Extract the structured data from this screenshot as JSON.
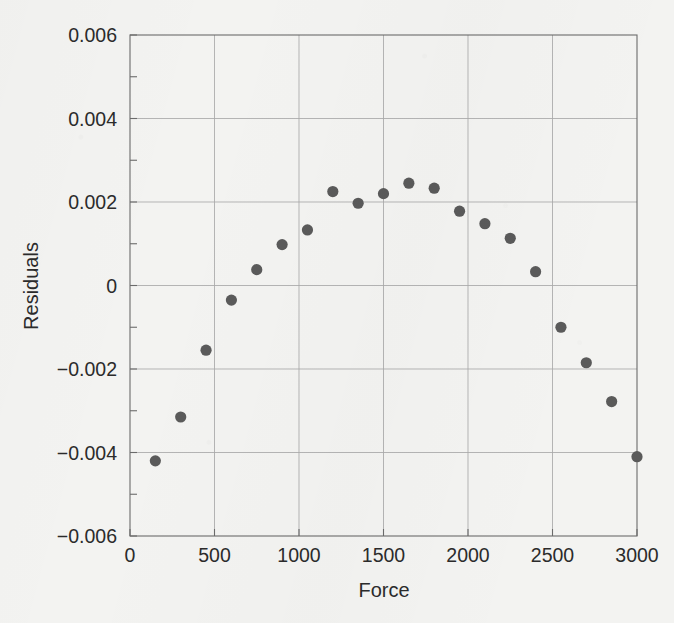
{
  "chart_data": {
    "type": "scatter",
    "title": "",
    "xlabel": "Force",
    "ylabel": "Residuals",
    "xlim": [
      0,
      3000
    ],
    "ylim": [
      -0.006,
      0.006
    ],
    "grid": true,
    "legend": null,
    "x_ticks": [
      0,
      500,
      1000,
      1500,
      2000,
      2500,
      3000
    ],
    "x_tick_labels": [
      "0",
      "500",
      "1000",
      "1500",
      "2000",
      "2500",
      "3000"
    ],
    "y_ticks": [
      -0.006,
      -0.004,
      -0.002,
      0,
      0.002,
      0.004,
      0.006
    ],
    "y_tick_labels": [
      "−0.006",
      "−0.004",
      "−0.002",
      "0",
      "0.002",
      "0.004",
      "0.006"
    ],
    "y_minor_ticks": [
      -0.005,
      -0.003,
      -0.001,
      0.001,
      0.003,
      0.005
    ],
    "marker": "filled-circle",
    "marker_color": "#5a5a5a",
    "marker_size": 5.6,
    "x": [
      150,
      300,
      450,
      600,
      750,
      900,
      1050,
      1200,
      1350,
      1500,
      1650,
      1800,
      1950,
      2100,
      2250,
      2400,
      2550,
      2700,
      2850,
      3000
    ],
    "y": [
      -0.0042,
      -0.00315,
      -0.00155,
      -0.00035,
      0.00038,
      0.00098,
      0.00133,
      0.00225,
      0.00197,
      0.0022,
      0.00245,
      0.00233,
      0.00178,
      0.00148,
      0.00113,
      0.00033,
      -0.001,
      -0.00185,
      -0.00278,
      -0.0041
    ],
    "series": [
      {
        "name": "residuals",
        "points": [
          {
            "x": 150,
            "y": -0.0042
          },
          {
            "x": 300,
            "y": -0.00315
          },
          {
            "x": 450,
            "y": -0.00155
          },
          {
            "x": 600,
            "y": -0.00035
          },
          {
            "x": 750,
            "y": 0.00038
          },
          {
            "x": 900,
            "y": 0.00098
          },
          {
            "x": 1050,
            "y": 0.00133
          },
          {
            "x": 1200,
            "y": 0.00225
          },
          {
            "x": 1350,
            "y": 0.00197
          },
          {
            "x": 1500,
            "y": 0.0022
          },
          {
            "x": 1650,
            "y": 0.00245
          },
          {
            "x": 1800,
            "y": 0.00233
          },
          {
            "x": 1950,
            "y": 0.00178
          },
          {
            "x": 2100,
            "y": 0.00148
          },
          {
            "x": 2250,
            "y": 0.00113
          },
          {
            "x": 2400,
            "y": 0.00033
          },
          {
            "x": 2550,
            "y": -0.001
          },
          {
            "x": 2700,
            "y": -0.00185
          },
          {
            "x": 2850,
            "y": -0.00278
          },
          {
            "x": 3000,
            "y": -0.0041
          }
        ]
      }
    ],
    "colors": {
      "background": "#f3f3f1",
      "marker": "#5a5a5a",
      "grid": "#a9a9a9",
      "axis": "#6b6b6b",
      "text": "#2b2b2b"
    }
  }
}
